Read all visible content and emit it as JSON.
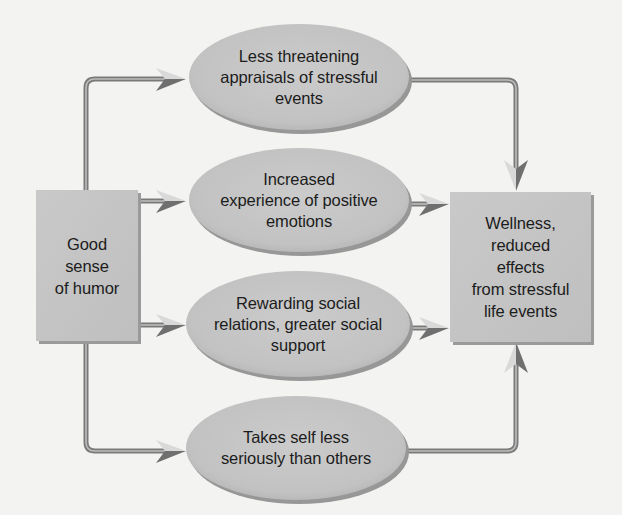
{
  "diagram": {
    "type": "flowchart",
    "colors": {
      "background": "#f3f3f1",
      "node_fill": "#c4c4c4",
      "node_shadow": "#8c8c8c",
      "connector": "#8a8a8a",
      "arrow_dark": "#6e6e6e",
      "arrow_light": "#d8d8d8",
      "text": "#1c1c1c"
    },
    "source": {
      "id": "humor",
      "label": "Good\nsense\nof humor"
    },
    "mediators": [
      {
        "id": "appraisals",
        "label": "Less threatening\nappraisals of stressful\nevents"
      },
      {
        "id": "positive-emotions",
        "label": "Increased\nexperience of positive\nemotions"
      },
      {
        "id": "social-support",
        "label": "Rewarding social\nrelations, greater social\nsupport"
      },
      {
        "id": "self-serious",
        "label": "Takes self less\nseriously than others"
      }
    ],
    "outcome": {
      "id": "wellness",
      "label": "Wellness,\nreduced\neffects\nfrom stressful\nlife events"
    },
    "edges": [
      {
        "from": "humor",
        "to": "appraisals"
      },
      {
        "from": "humor",
        "to": "positive-emotions"
      },
      {
        "from": "humor",
        "to": "social-support"
      },
      {
        "from": "humor",
        "to": "self-serious"
      },
      {
        "from": "appraisals",
        "to": "wellness"
      },
      {
        "from": "positive-emotions",
        "to": "wellness"
      },
      {
        "from": "social-support",
        "to": "wellness"
      },
      {
        "from": "self-serious",
        "to": "wellness"
      }
    ]
  }
}
